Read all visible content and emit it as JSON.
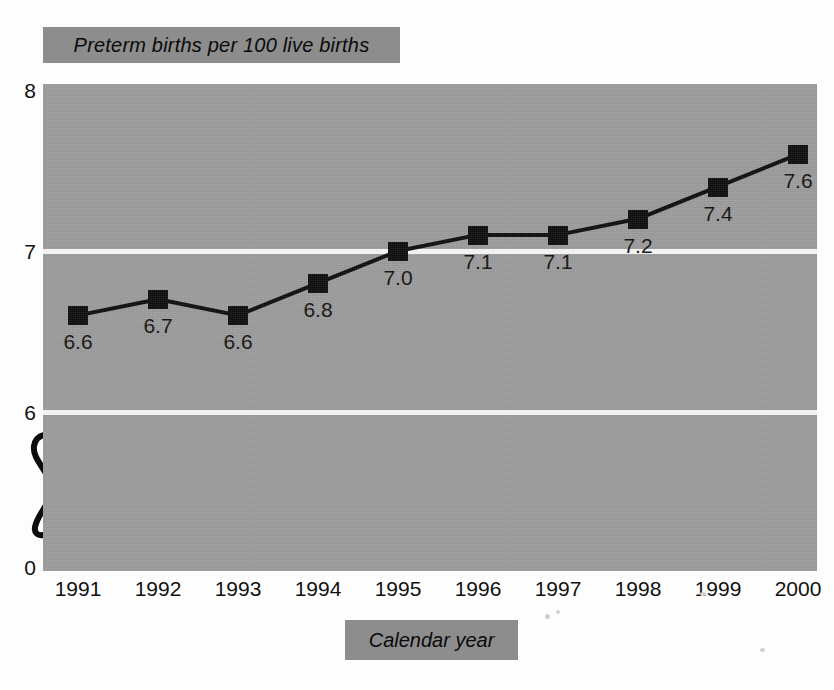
{
  "chart_data": {
    "type": "line",
    "title": "Preterm births per 100 live births",
    "xlabel": "Calendar year",
    "ylabel": "",
    "categories": [
      "1991",
      "1992",
      "1993",
      "1994",
      "1995",
      "1996",
      "1997",
      "1998",
      "1999",
      "2000"
    ],
    "values": [
      6.6,
      6.7,
      6.6,
      6.8,
      7.0,
      7.1,
      7.1,
      7.2,
      7.4,
      7.6
    ],
    "point_labels": [
      "6.6",
      "6.7",
      "6.6",
      "6.8",
      "7.0",
      "7.1",
      "7.1",
      "7.2",
      "7.4",
      "7.6"
    ],
    "ytick_labels": [
      "8",
      "7",
      "6",
      "0"
    ],
    "ytick_values": [
      8,
      7,
      6,
      0
    ],
    "ylim": [
      6,
      8
    ],
    "axis_break": true,
    "axis_break_glyph": "S",
    "grid": true,
    "gridline_values": [
      7,
      6
    ],
    "legend": null,
    "legend_position": "none",
    "series_name": "Preterm births per 100 live births",
    "marker_style": "filled-square",
    "line_color": "#0d0d0d",
    "marker_color": "#0d0d0d",
    "plot_background_color": "#9b9b9b",
    "gridline_color": "#f7f7f7",
    "band_color": "#8d8d8d",
    "text_color": "#111111"
  },
  "figure": {
    "title_band_label": "Preterm births per 100 live births",
    "x_axis_title_band_label": "Calendar year"
  }
}
